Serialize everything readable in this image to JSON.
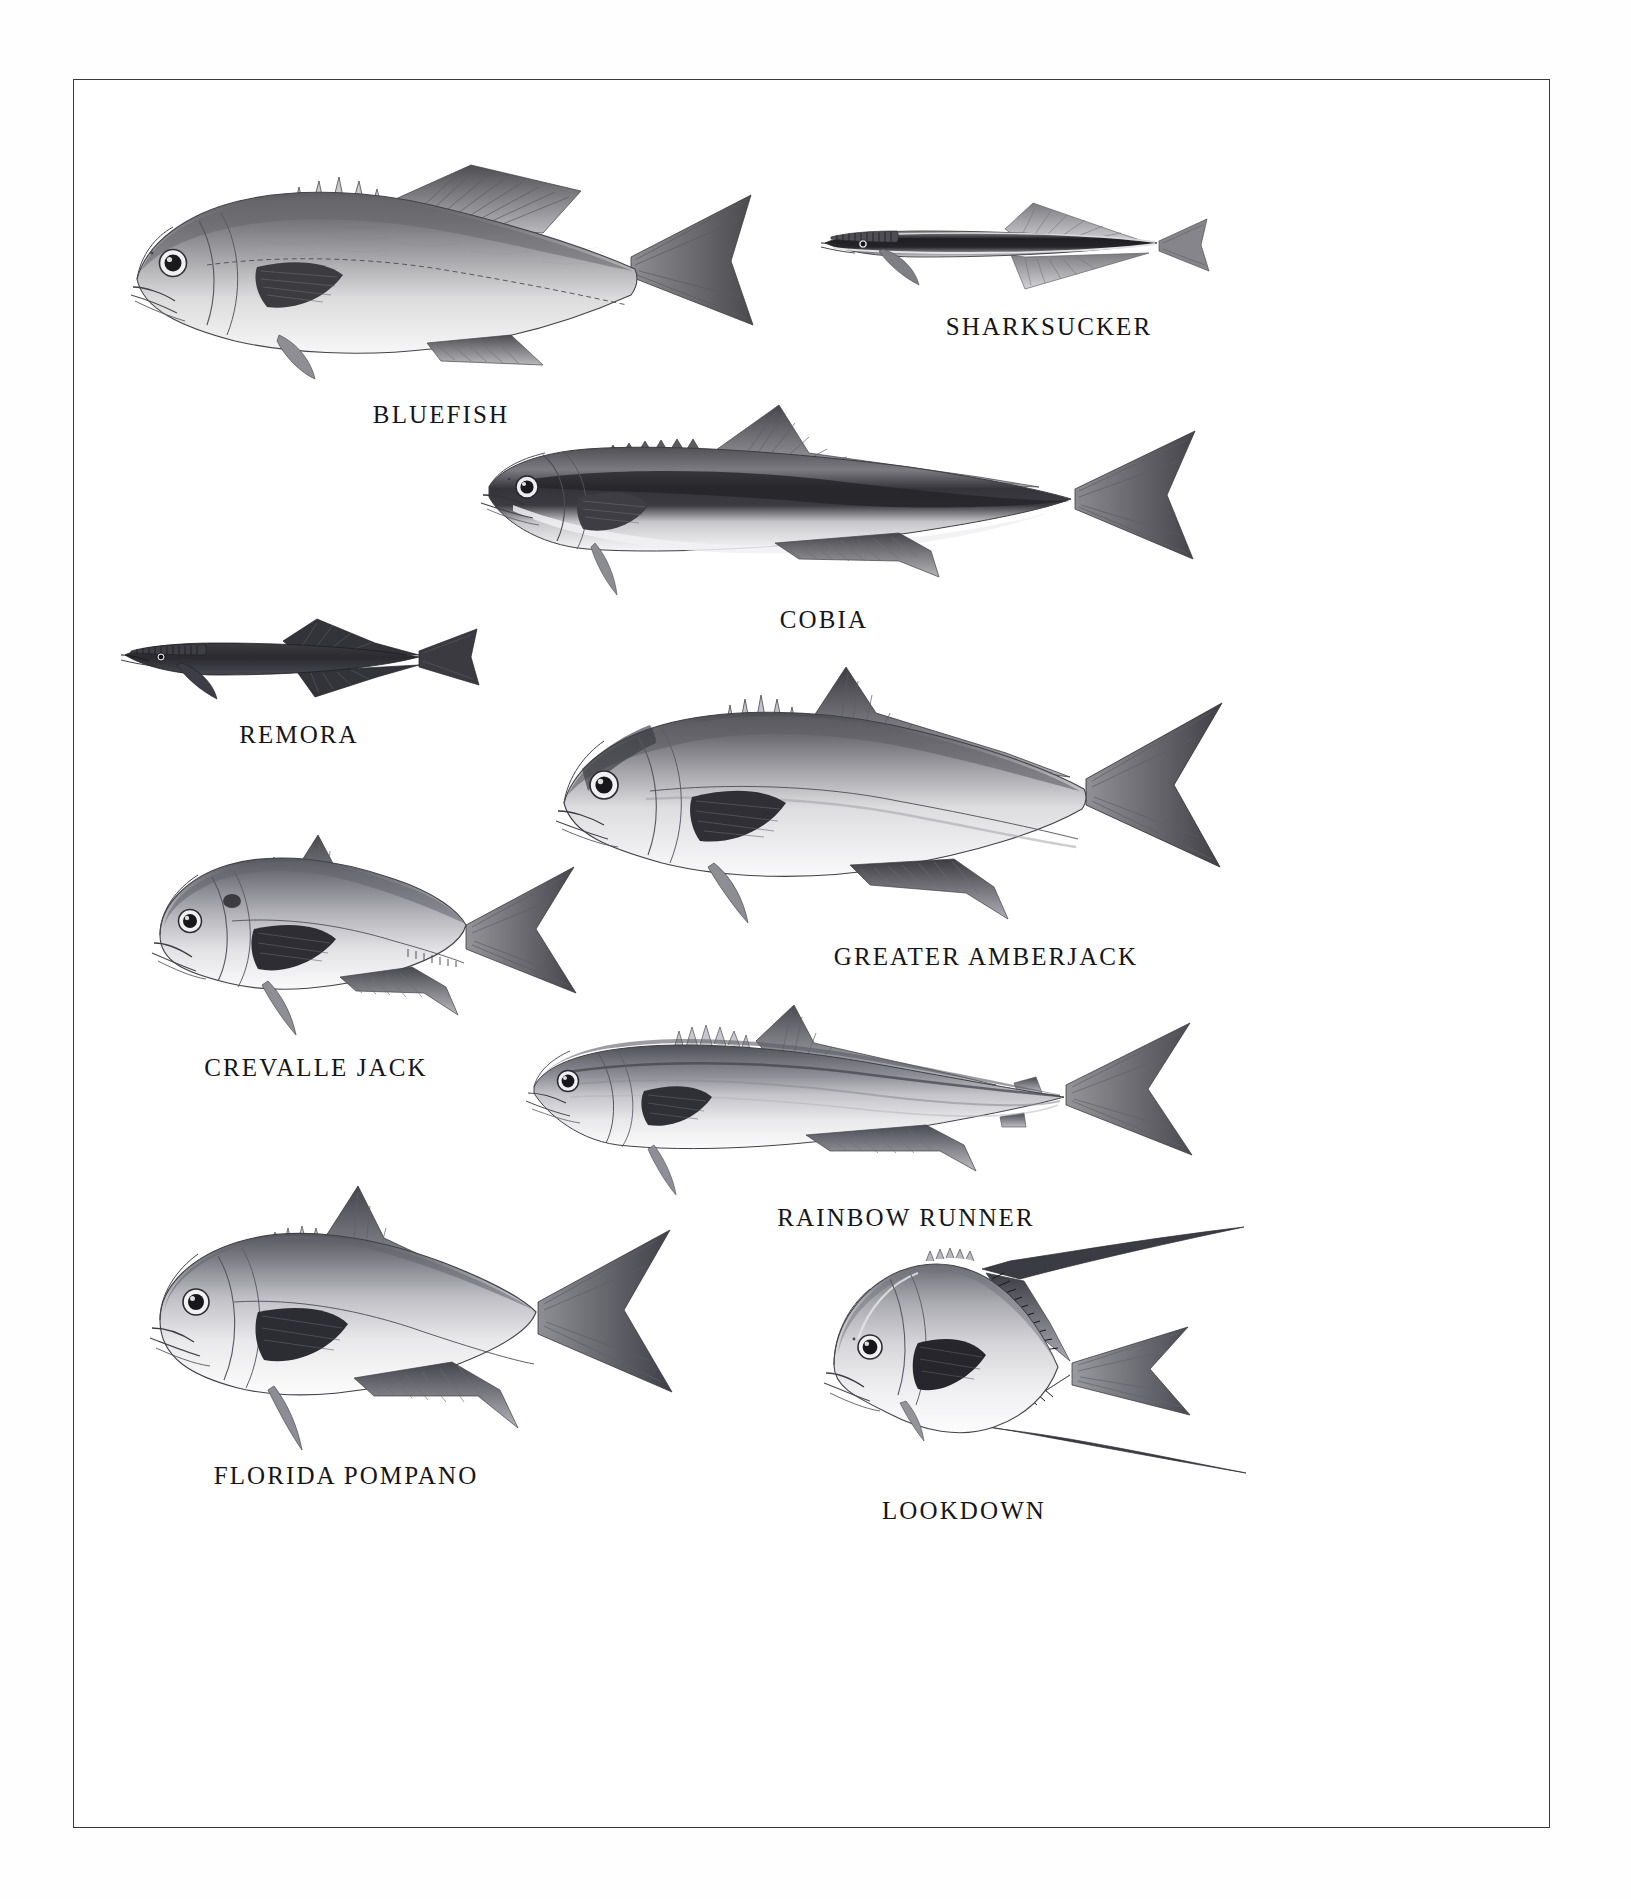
{
  "plate": {
    "background_color": "#ffffff",
    "border_color": "#3a3a3a",
    "label_color": "#15151a",
    "medium": "grayscale scientific illustration"
  },
  "species": [
    {
      "id": "bluefish",
      "label": "BLUEFISH",
      "body_form": "elongate-oval, forked tail, two dorsal fins, dark dusky back with pale belly",
      "label_x": 364,
      "label_y": 360,
      "art_x": 110,
      "art_y": 128,
      "art_w": 650,
      "art_h": 240
    },
    {
      "id": "sharksucker",
      "label": "SHARKSUCKER",
      "body_form": "very slender, cephalic sucking disc on head, broad dark lateral stripe, truncate tail",
      "label_x": 935,
      "label_y": 287,
      "art_x": 818,
      "art_y": 192,
      "art_w": 372,
      "art_h": 82
    },
    {
      "id": "cobia",
      "label": "COBIA",
      "body_form": "elongate, broad flat head, low dorsal spines, dark lateral band, lunate tail",
      "label_x": 740,
      "label_y": 562,
      "art_x": 478,
      "art_y": 400,
      "art_w": 720,
      "art_h": 178
    },
    {
      "id": "remora",
      "label": "REMORA",
      "body_form": "short slender body, uniformly dark, sucking disc on head, rounded tail",
      "label_x": 243,
      "label_y": 698,
      "art_x": 120,
      "art_y": 612,
      "art_w": 360,
      "art_h": 78
    },
    {
      "id": "greater-amberjack",
      "label": "GREATER AMBERJACK",
      "body_form": "robust fusiform body, dark nuchal bar through eye, deeply forked tail",
      "label_x": 783,
      "label_y": 890,
      "art_x": 548,
      "art_y": 650,
      "art_w": 670,
      "art_h": 256
    },
    {
      "id": "crevalle-jack",
      "label": "CREVALLE JACK",
      "body_form": "deep blunt-headed body, steep forehead, black opercular spot, scutes on tail base",
      "label_x": 228,
      "label_y": 978,
      "art_x": 148,
      "art_y": 828,
      "art_w": 420,
      "art_h": 190
    },
    {
      "id": "rainbow-runner",
      "label": "RAINBOW RUNNER",
      "body_form": "slender streamlined body, pointed snout, longitudinal stripes, small finlets",
      "label_x": 733,
      "label_y": 1147,
      "art_x": 528,
      "art_y": 1000,
      "art_w": 650,
      "art_h": 168
    },
    {
      "id": "florida-pompano",
      "label": "FLORIDA POMPANO",
      "body_form": "deep compressed body, blunt snout, falcate dorsal and anal fins, forked tail",
      "label_x": 162,
      "label_y": 1398,
      "art_x": 148,
      "art_y": 1178,
      "art_w": 500,
      "art_h": 230
    },
    {
      "id": "lookdown",
      "label": "LOOKDOWN",
      "body_form": "very deep strongly compressed body, steep blunt head, long trailing dorsal and anal filaments",
      "label_x": 800,
      "label_y": 1400,
      "art_x": 820,
      "art_y": 1218,
      "art_w": 340,
      "art_h": 216
    }
  ]
}
